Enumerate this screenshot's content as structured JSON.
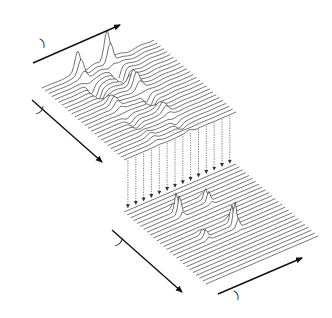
{
  "diagram": {
    "top_plane": {
      "axis_frequency_label": "Frequency (f",
      "axis_frequency_sub": "2",
      "axis_delay_label": "Delay time (t",
      "axis_delay_sub": "1",
      "peak_s_label": "S",
      "peak_i_label": "I"
    },
    "transform_caption": {
      "line1": "Fourier transform of t",
      "line1_sub": "1",
      "line2_pre": "for each f",
      "line2_sub": "2",
      "line2_post": " “slice”"
    },
    "bottom_plane": {
      "axis_f1_label": "Frequency (f",
      "axis_f1_sub": "1",
      "axis_f2_label": "Frequency (f",
      "axis_f2_sub": "2",
      "f1_s_label": "S",
      "f1_i_label": "I",
      "f2_s_label": "S",
      "f2_i_label": "I"
    },
    "colors": {
      "line": "#333333",
      "arrow": "#111111",
      "text": "#222222"
    }
  }
}
